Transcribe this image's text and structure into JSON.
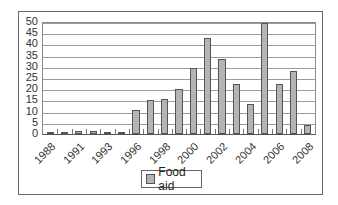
{
  "chart_data": {
    "type": "bar",
    "title": "",
    "xlabel": "",
    "ylabel": "",
    "ylim": [
      0,
      50
    ],
    "yticks": [
      0,
      5,
      10,
      15,
      20,
      25,
      30,
      35,
      40,
      45,
      50
    ],
    "grid": true,
    "legend_position": "bottom",
    "categories": [
      "1988",
      "1990",
      "1991",
      "1992",
      "1993",
      "1995",
      "1996",
      "1997",
      "1998",
      "1999",
      "2000",
      "2001",
      "2002",
      "2003",
      "2004",
      "2005",
      "2006",
      "2007",
      "2008"
    ],
    "x_tick_labels": [
      "1988",
      "1991",
      "1993",
      "1996",
      "1998",
      "2000",
      "2002",
      "2004",
      "2006",
      "2008"
    ],
    "series": [
      {
        "name": "Food aid",
        "color": "#b4b4b4",
        "values": [
          1,
          0.5,
          1.5,
          1.5,
          1,
          0.5,
          10.5,
          15,
          15.5,
          20,
          29.5,
          43,
          33.5,
          22.5,
          13.5,
          49.5,
          22.5,
          28,
          4
        ]
      }
    ]
  },
  "legend": {
    "label": "Food aid"
  }
}
